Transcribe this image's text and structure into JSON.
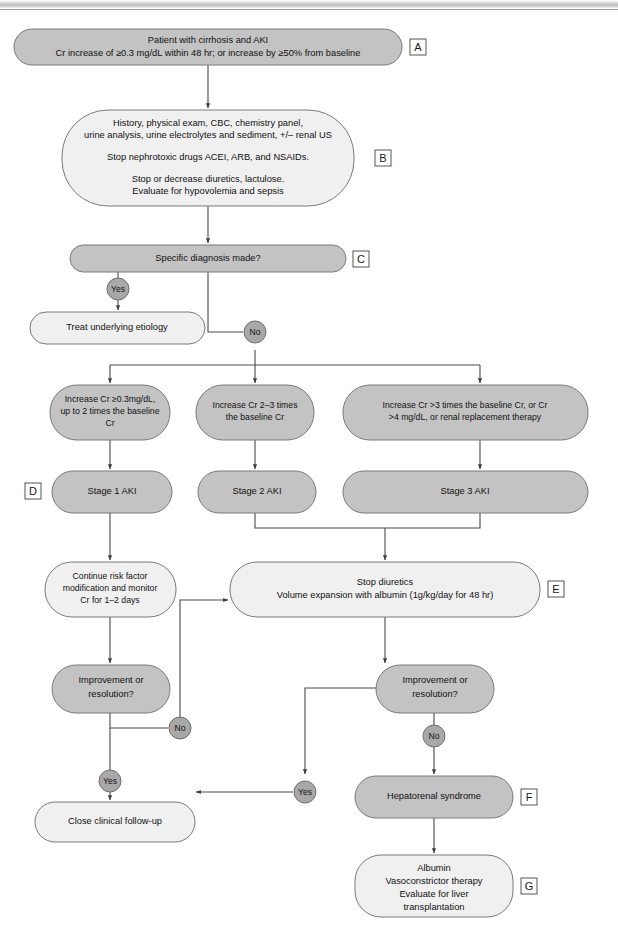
{
  "diagram": {
    "colors": {
      "node_dark": "#c3c3c3",
      "node_light": "#f0f0f0",
      "decision_circle": "#a8a8a8",
      "connector": "#4a4a4a",
      "outline": "#7a7a7a"
    },
    "nodes": {
      "a": {
        "key": "A",
        "lines": [
          "Patient with cirrhosis and AKI",
          "Cr increase of ≥0.3 mg/dL within 48 hr; or increase by ≥50% from baseline"
        ]
      },
      "b": {
        "key": "B",
        "lines": [
          "History, physical exam, CBC, chemistry panel,",
          "urine analysis, urine electrolytes and sediment, +/– renal US",
          "",
          "Stop nephrotoxic drugs ACEI, ARB, and NSAIDs.",
          "",
          "Stop or decrease diuretics, lactulose.",
          "Evaluate for hypovolemia and sepsis"
        ]
      },
      "c": {
        "key": "C",
        "lines": [
          "Specific diagnosis made?"
        ]
      },
      "treat_etiology": {
        "key": "",
        "lines": [
          "Treat underlying etiology"
        ]
      },
      "criteria1": {
        "key": "",
        "lines": [
          "Increase Cr ≥0.3mg/dL,",
          "up to 2 times the baseline",
          "Cr"
        ]
      },
      "criteria2": {
        "key": "",
        "lines": [
          "Increase Cr 2–3 times",
          "the baseline Cr"
        ]
      },
      "criteria3": {
        "key": "",
        "lines": [
          "Increase Cr >3 times the baseline Cr, or Cr",
          ">4 mg/dL, or renal replacement therapy"
        ]
      },
      "stage1": {
        "key": "D",
        "lines": [
          "Stage 1 AKI"
        ]
      },
      "stage2": {
        "key": "",
        "lines": [
          "Stage 2 AKI"
        ]
      },
      "stage3": {
        "key": "",
        "lines": [
          "Stage 3 AKI"
        ]
      },
      "continue_risk": {
        "key": "",
        "lines": [
          "Continue risk factor",
          "modification and monitor",
          "Cr for 1–2 days"
        ]
      },
      "stop_diuretics": {
        "key": "E",
        "lines": [
          "Stop diuretics",
          "Volume expansion with albumin (1g/kg/day for 48 hr)"
        ]
      },
      "improve_left": {
        "key": "",
        "lines": [
          "Improvement or",
          "resolution?"
        ]
      },
      "improve_right": {
        "key": "",
        "lines": [
          "Improvement or",
          "resolution?"
        ]
      },
      "close_followup": {
        "key": "",
        "lines": [
          "Close clinical follow-up"
        ]
      },
      "hrs": {
        "key": "F",
        "lines": [
          "Hepatorenal syndrome"
        ]
      },
      "treatment": {
        "key": "G",
        "lines": [
          "Albumin",
          "Vasoconstrictor therapy",
          "Evaluate for liver",
          "transplantation"
        ]
      }
    },
    "decisions": {
      "c_yes": "Yes",
      "c_no": "No",
      "left_no": "No",
      "left_yes": "Yes",
      "right_no": "No",
      "right_yes": "Yes"
    },
    "labels": {
      "a": "A",
      "b": "B",
      "c": "C",
      "d": "D",
      "e": "E",
      "f": "F",
      "g": "G"
    }
  }
}
